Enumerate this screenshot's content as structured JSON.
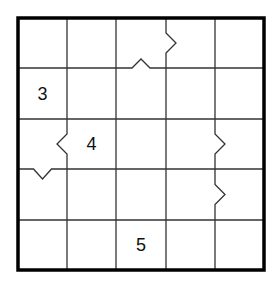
{
  "puzzle": {
    "rows": 5,
    "cols": 5,
    "colors": {
      "background": "#ffffff",
      "grid_line": "#333333",
      "border": "#000000",
      "text": "#111111"
    },
    "clues": [
      {
        "row": 1,
        "col": 0,
        "value": "3"
      },
      {
        "row": 2,
        "col": 1,
        "value": "4"
      },
      {
        "row": 4,
        "col": 2,
        "value": "5"
      }
    ],
    "notches": [
      {
        "type": "vertical",
        "line_col": 3,
        "row": 0,
        "direction": "right"
      },
      {
        "type": "horizontal",
        "line_row": 1,
        "col": 2,
        "direction": "up"
      },
      {
        "type": "vertical",
        "line_col": 1,
        "row": 2,
        "direction": "left"
      },
      {
        "type": "horizontal",
        "line_row": 3,
        "col": 0,
        "direction": "down"
      },
      {
        "type": "vertical",
        "line_col": 4,
        "row": 2,
        "direction": "right"
      },
      {
        "type": "vertical",
        "line_col": 4,
        "row": 3,
        "direction": "right"
      }
    ]
  }
}
